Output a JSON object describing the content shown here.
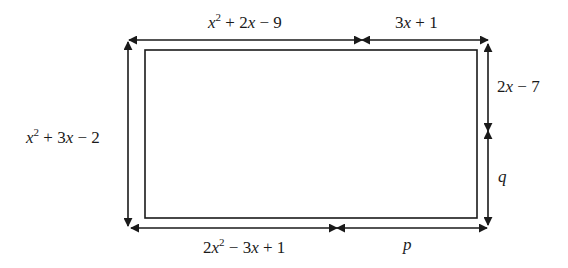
{
  "diagram": {
    "type": "rectangle-with-dimension-arrows",
    "colors": {
      "line": "#1a1a1a",
      "background": "#ffffff"
    },
    "labels": {
      "top_left": {
        "var": "x",
        "sup": "2",
        "rest": " + 2",
        "var2": "x",
        "tail": " − 9"
      },
      "top_right": {
        "pre": "3",
        "var": "x",
        "tail": " + 1"
      },
      "left": {
        "var": "x",
        "sup": "2",
        "rest": " + 3",
        "var2": "x",
        "tail": " − 2"
      },
      "right_top": {
        "pre": "2",
        "var": "x",
        "tail": " − 7"
      },
      "right_bottom": {
        "var": "q"
      },
      "bottom_left": {
        "pre": "2",
        "var": "x",
        "sup": "2",
        "rest": " − 3",
        "var2": "x",
        "tail": " + 1"
      },
      "bottom_right": {
        "var": "p"
      }
    }
  }
}
